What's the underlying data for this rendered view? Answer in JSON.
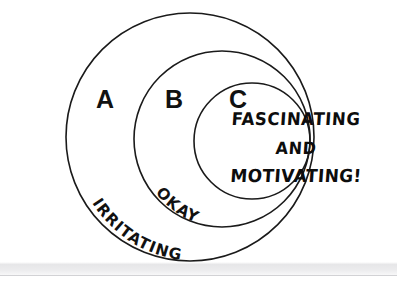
{
  "figure": {
    "type": "concentric-venn-diagram",
    "title_text_visible": false,
    "background_color": "#ffffff",
    "stroke_color": "#1a1a1a",
    "text_color": "#111111",
    "canvas": {
      "width": 397,
      "height": 285
    }
  },
  "tiers": [
    {
      "id": "a",
      "letter": "A",
      "letter_x": 105,
      "letter_y": 108,
      "curved_label": "IRRITATING",
      "ring": {
        "cx": 190,
        "cy": 137,
        "r": 124
      }
    },
    {
      "id": "b",
      "letter": "B",
      "letter_x": 174,
      "letter_y": 108,
      "curved_label": "OKAY",
      "ring": {
        "cx": 222,
        "cy": 139,
        "r": 88
      }
    },
    {
      "id": "c",
      "letter": "C",
      "letter_x": 238,
      "letter_y": 108,
      "curved_label": "",
      "ring": {
        "cx": 252,
        "cy": 141,
        "r": 58
      }
    }
  ],
  "inner_note": {
    "line1": "FASCINATING",
    "line2": "AND",
    "line3": "MOTIVATING!"
  },
  "scan_artifact": {
    "band_top": 262,
    "band_height": 14,
    "rule_top": 275,
    "color": "#e9e9eb"
  }
}
